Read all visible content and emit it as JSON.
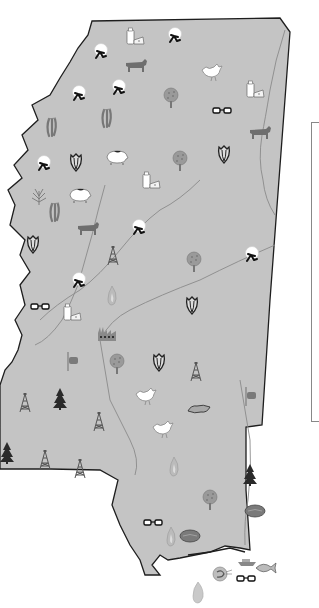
{
  "map": {
    "region": "Mississippi",
    "fill_color": "#c4c4c4",
    "border_color": "#222222",
    "river_color": "#8a8a8a",
    "legend": {
      "visible": true,
      "entries": []
    }
  },
  "icon_types": {
    "cotton": "cotton-icon",
    "dairy": "dairy-icon",
    "cattle": "cattle-icon",
    "poultry": "chicken-icon",
    "corn": "corn-icon",
    "soybeans": "soybean-icon",
    "tree": "fruit-tree-icon",
    "glasses": "glasses-icon",
    "hog": "hog-icon",
    "rice": "rice-icon",
    "oil": "oil-derrick-icon",
    "pine": "pine-tree-icon",
    "factory": "factory-icon",
    "sweet_potato": "sweet-potato-icon",
    "natural_gas": "flame-icon",
    "flag": "flag-icon",
    "seafood": "fish-icon",
    "shrimp": "shrimp-icon",
    "oyster": "oyster-icon",
    "pecan": "pecan-icon",
    "ship": "ship-icon"
  },
  "icons": [
    {
      "type": "dairy",
      "x": 135,
      "y": 38
    },
    {
      "type": "cotton",
      "x": 101,
      "y": 52
    },
    {
      "type": "cotton",
      "x": 175,
      "y": 36
    },
    {
      "type": "cattle",
      "x": 136,
      "y": 66
    },
    {
      "type": "cotton",
      "x": 79,
      "y": 94
    },
    {
      "type": "cotton",
      "x": 119,
      "y": 88
    },
    {
      "type": "poultry",
      "x": 211,
      "y": 72
    },
    {
      "type": "dairy",
      "x": 255,
      "y": 91
    },
    {
      "type": "tree",
      "x": 171,
      "y": 98
    },
    {
      "type": "soybeans",
      "x": 52,
      "y": 127
    },
    {
      "type": "soybeans",
      "x": 107,
      "y": 118
    },
    {
      "type": "glasses",
      "x": 222,
      "y": 111
    },
    {
      "type": "cattle",
      "x": 260,
      "y": 133
    },
    {
      "type": "cotton",
      "x": 44,
      "y": 164
    },
    {
      "type": "corn",
      "x": 76,
      "y": 162
    },
    {
      "type": "hog",
      "x": 117,
      "y": 157
    },
    {
      "type": "dairy",
      "x": 151,
      "y": 182
    },
    {
      "type": "tree",
      "x": 180,
      "y": 161
    },
    {
      "type": "corn",
      "x": 224,
      "y": 154
    },
    {
      "type": "rice",
      "x": 39,
      "y": 197
    },
    {
      "type": "hog",
      "x": 80,
      "y": 195
    },
    {
      "type": "soybeans",
      "x": 55,
      "y": 212
    },
    {
      "type": "cattle",
      "x": 88,
      "y": 229
    },
    {
      "type": "cotton",
      "x": 139,
      "y": 228
    },
    {
      "type": "corn",
      "x": 33,
      "y": 244
    },
    {
      "type": "oil",
      "x": 113,
      "y": 256
    },
    {
      "type": "tree",
      "x": 194,
      "y": 262
    },
    {
      "type": "cotton",
      "x": 252,
      "y": 255
    },
    {
      "type": "cotton",
      "x": 79,
      "y": 281
    },
    {
      "type": "natural_gas",
      "x": 112,
      "y": 296
    },
    {
      "type": "glasses",
      "x": 40,
      "y": 307
    },
    {
      "type": "dairy",
      "x": 72,
      "y": 314
    },
    {
      "type": "corn",
      "x": 192,
      "y": 305
    },
    {
      "type": "factory",
      "x": 107,
      "y": 335
    },
    {
      "type": "flag",
      "x": 72,
      "y": 361
    },
    {
      "type": "tree",
      "x": 117,
      "y": 364
    },
    {
      "type": "corn",
      "x": 159,
      "y": 362
    },
    {
      "type": "oil",
      "x": 196,
      "y": 372
    },
    {
      "type": "pine",
      "x": 60,
      "y": 399
    },
    {
      "type": "oil",
      "x": 25,
      "y": 403
    },
    {
      "type": "poultry",
      "x": 145,
      "y": 396
    },
    {
      "type": "flag",
      "x": 250,
      "y": 396
    },
    {
      "type": "sweet_potato",
      "x": 199,
      "y": 409
    },
    {
      "type": "oil",
      "x": 99,
      "y": 422
    },
    {
      "type": "poultry",
      "x": 162,
      "y": 429
    },
    {
      "type": "pine",
      "x": 7,
      "y": 453
    },
    {
      "type": "oil",
      "x": 45,
      "y": 460
    },
    {
      "type": "oil",
      "x": 80,
      "y": 469
    },
    {
      "type": "natural_gas",
      "x": 174,
      "y": 467
    },
    {
      "type": "pine",
      "x": 250,
      "y": 475
    },
    {
      "type": "tree",
      "x": 210,
      "y": 500
    },
    {
      "type": "pecan",
      "x": 255,
      "y": 511
    },
    {
      "type": "glasses",
      "x": 153,
      "y": 523
    },
    {
      "type": "natural_gas",
      "x": 171,
      "y": 537
    },
    {
      "type": "pecan",
      "x": 190,
      "y": 536
    },
    {
      "type": "ship",
      "x": 247,
      "y": 562
    },
    {
      "type": "seafood",
      "x": 265,
      "y": 568
    },
    {
      "type": "shrimp",
      "x": 220,
      "y": 574
    },
    {
      "type": "glasses",
      "x": 246,
      "y": 579
    },
    {
      "type": "oyster",
      "x": 198,
      "y": 593
    }
  ]
}
